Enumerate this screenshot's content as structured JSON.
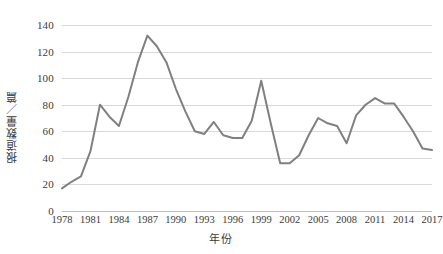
{
  "chart_data": {
    "type": "line",
    "title": "",
    "xlabel": "年份",
    "ylabel": "报道数量／篇",
    "xlim": [
      1978,
      2017
    ],
    "ylim": [
      0,
      140
    ],
    "ytick_labels": [
      "0",
      "20",
      "40",
      "60",
      "80",
      "100",
      "120",
      "140"
    ],
    "yticks": [
      0,
      20,
      40,
      60,
      80,
      100,
      120,
      140
    ],
    "xtick_labels": [
      "1978",
      "1981",
      "1984",
      "1987",
      "1990",
      "1993",
      "1996",
      "1999",
      "2002",
      "2005",
      "2008",
      "2011",
      "2014",
      "2017"
    ],
    "xticks": [
      1978,
      1981,
      1984,
      1987,
      1990,
      1993,
      1996,
      1999,
      2002,
      2005,
      2008,
      2011,
      2014,
      2017
    ],
    "grid": true,
    "legend": false,
    "legend_position": "none",
    "line_color": "#808080",
    "grid_color": "#d9d9d9",
    "series": [
      {
        "name": "报道数量",
        "x": [
          1978,
          1979,
          1980,
          1981,
          1982,
          1983,
          1984,
          1985,
          1986,
          1987,
          1988,
          1989,
          1990,
          1991,
          1992,
          1993,
          1994,
          1995,
          1996,
          1997,
          1998,
          1999,
          2000,
          2001,
          2002,
          2003,
          2004,
          2005,
          2006,
          2007,
          2008,
          2009,
          2010,
          2011,
          2012,
          2013,
          2014,
          2015,
          2016,
          2017
        ],
        "values": [
          17,
          22,
          26,
          45,
          80,
          71,
          64,
          86,
          112,
          132,
          124,
          112,
          92,
          75,
          60,
          58,
          67,
          57,
          55,
          55,
          68,
          98,
          66,
          36,
          36,
          42,
          57,
          70,
          66,
          64,
          51,
          72,
          80,
          85,
          81,
          81,
          71,
          60,
          47,
          46
        ]
      }
    ]
  }
}
